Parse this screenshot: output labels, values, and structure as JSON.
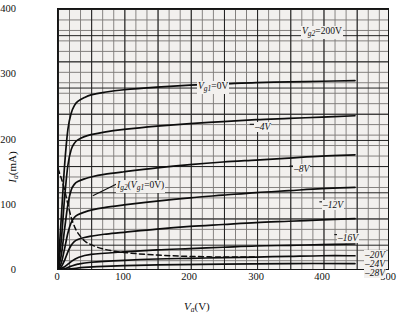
{
  "chart_data": {
    "type": "line",
    "title": "",
    "xlabel": "Va (V)",
    "ylabel": "Ia (mA)",
    "xlim": [
      0,
      500
    ],
    "ylim": [
      0,
      400
    ],
    "xticks": [
      "0",
      "100",
      "200",
      "300",
      "400",
      "500"
    ],
    "yticks": [
      "0",
      "100",
      "200",
      "300",
      "400"
    ],
    "grid": true,
    "legend_position": "in-plot annotations",
    "screen_voltage_note": "Vg2=200V",
    "series": [
      {
        "name": "Vg1=0V",
        "label": "Vg1=0V",
        "style": "solid",
        "x": [
          0,
          5,
          10,
          15,
          20,
          25,
          30,
          40,
          50,
          70,
          100,
          150,
          200,
          250,
          300,
          350,
          400,
          450
        ],
        "y": [
          0,
          80,
          160,
          215,
          240,
          252,
          258,
          264,
          268,
          272,
          276,
          280,
          283,
          285,
          287,
          288,
          289,
          290
        ]
      },
      {
        "name": "-4V",
        "label": "-4V",
        "style": "solid",
        "x": [
          0,
          5,
          10,
          15,
          20,
          25,
          30,
          40,
          50,
          70,
          100,
          150,
          200,
          250,
          300,
          350,
          400,
          450
        ],
        "y": [
          0,
          45,
          110,
          160,
          184,
          194,
          199,
          204,
          207,
          211,
          215,
          220,
          224,
          227,
          230,
          232,
          234,
          236
        ]
      },
      {
        "name": "-8V",
        "label": "-8V",
        "style": "solid",
        "x": [
          0,
          5,
          10,
          15,
          20,
          25,
          30,
          40,
          50,
          70,
          100,
          150,
          200,
          250,
          300,
          350,
          400,
          450
        ],
        "y": [
          0,
          22,
          62,
          100,
          122,
          131,
          135,
          139,
          142,
          146,
          150,
          156,
          161,
          165,
          168,
          171,
          174,
          176
        ]
      },
      {
        "name": "-12V",
        "label": "-12V",
        "style": "solid",
        "x": [
          0,
          5,
          10,
          15,
          20,
          25,
          30,
          40,
          50,
          70,
          100,
          150,
          200,
          250,
          300,
          350,
          400,
          450
        ],
        "y": [
          0,
          10,
          32,
          56,
          72,
          80,
          84,
          88,
          91,
          95,
          99,
          105,
          110,
          114,
          118,
          121,
          124,
          126
        ]
      },
      {
        "name": "-16V",
        "label": "-16V",
        "style": "solid",
        "x": [
          0,
          5,
          10,
          15,
          20,
          25,
          30,
          40,
          50,
          70,
          100,
          150,
          200,
          250,
          300,
          350,
          400,
          450
        ],
        "y": [
          0,
          4,
          14,
          27,
          37,
          43,
          46,
          49,
          51,
          54,
          57,
          62,
          66,
          69,
          72,
          74,
          76,
          78
        ]
      },
      {
        "name": "-20V",
        "label": "-20V",
        "style": "solid",
        "x": [
          0,
          10,
          20,
          30,
          50,
          100,
          150,
          200,
          250,
          300,
          350,
          400,
          450
        ],
        "y": [
          0,
          4,
          12,
          18,
          23,
          27,
          30,
          32,
          34,
          36,
          37,
          38,
          39
        ]
      },
      {
        "name": "-24V",
        "label": "-24V",
        "style": "solid",
        "x": [
          0,
          10,
          20,
          30,
          50,
          100,
          150,
          200,
          250,
          300,
          350,
          400,
          450
        ],
        "y": [
          0,
          1,
          5,
          8,
          11,
          14,
          16,
          17,
          18,
          19,
          20,
          21,
          21
        ]
      },
      {
        "name": "-28V",
        "label": "-28V",
        "style": "solid",
        "x": [
          0,
          20,
          40,
          80,
          150,
          250,
          350,
          450
        ],
        "y": [
          0,
          1,
          3,
          5,
          7,
          8,
          9,
          9
        ]
      },
      {
        "name": "Ig2 (Vg1=0V)",
        "label": "Ig2(Vg1=0V)",
        "style": "dashed",
        "x": [
          0,
          5,
          10,
          15,
          20,
          25,
          30,
          40,
          50,
          70,
          100,
          150,
          200,
          250,
          300
        ],
        "y": [
          155,
          140,
          122,
          100,
          80,
          66,
          56,
          44,
          38,
          31,
          26,
          22,
          20,
          19,
          19
        ]
      }
    ],
    "annotations": [
      {
        "text": "Vg2=200V",
        "at_pixel": [
          300,
          30
        ]
      },
      {
        "text": "Vg1=0V",
        "at_pixel": [
          196,
          84
        ]
      },
      {
        "text": "-4V",
        "at_pixel": [
          250,
          124
        ]
      },
      {
        "text": "-8V",
        "at_pixel": [
          290,
          166
        ]
      },
      {
        "text": "-12V",
        "at_pixel": [
          320,
          202
        ]
      },
      {
        "text": "-16V",
        "at_pixel": [
          335,
          235
        ]
      },
      {
        "text": "-20V",
        "at_pixel": [
          368,
          254
        ]
      },
      {
        "text": "-24V",
        "at_pixel": [
          368,
          263
        ]
      },
      {
        "text": "-28V",
        "at_pixel": [
          368,
          272
        ]
      },
      {
        "text": "Ig2(Vg1=0V)",
        "at_pixel": [
          118,
          183
        ]
      }
    ]
  },
  "axes": {
    "y": {
      "label_main": "I",
      "label_sub": "a",
      "label_unit": "(mA)",
      "ticks": [
        "400",
        "300",
        "200",
        "100",
        "0"
      ]
    },
    "x": {
      "label_main": "V",
      "label_sub": "a",
      "label_unit": "(V)",
      "ticks": [
        "0",
        "100",
        "200",
        "300",
        "400",
        "500"
      ]
    }
  },
  "labels": {
    "vg2": {
      "v": "V",
      "sub": "g2",
      "rest": "=200V"
    },
    "vg1_0": {
      "v": "V",
      "sub": "g1",
      "rest": "=0V"
    },
    "m4": "–4V",
    "m8": "–8V",
    "m12": "–12V",
    "m16": "–16V",
    "m20": "–20V",
    "m24": "–24V",
    "m28": "–28V",
    "ig2": {
      "i": "I",
      "isub": "g2",
      "open": "(",
      "v": "V",
      "vsub": "g1",
      "rest": "=0V)"
    }
  }
}
